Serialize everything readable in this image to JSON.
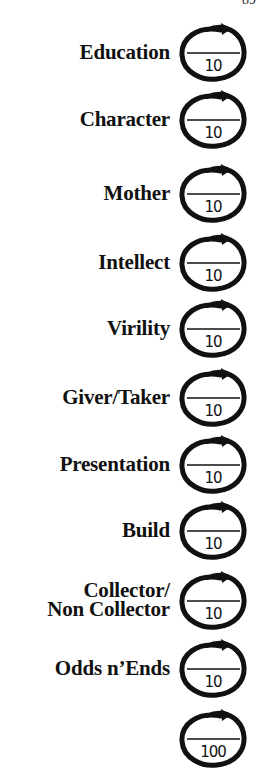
{
  "page_number": "89",
  "scorecard": {
    "rows": [
      {
        "label": "Education",
        "score": "",
        "max": "10"
      },
      {
        "label": "Character",
        "score": "",
        "max": "10"
      },
      {
        "label": "Mother",
        "score": "",
        "max": "10"
      },
      {
        "label": "Intellect",
        "score": "",
        "max": "10"
      },
      {
        "label": "Virility",
        "score": "",
        "max": "10"
      },
      {
        "label": "Giver/Taker",
        "score": "",
        "max": "10"
      },
      {
        "label": "Presentation",
        "score": "",
        "max": "10"
      },
      {
        "label": "Build",
        "score": "",
        "max": "10"
      },
      {
        "label": "Collector/\nNon Collector",
        "score": "",
        "max": "10"
      },
      {
        "label": "Odds n’Ends",
        "score": "",
        "max": "10"
      }
    ],
    "total": {
      "label": "",
      "score": "",
      "max": "100"
    }
  }
}
